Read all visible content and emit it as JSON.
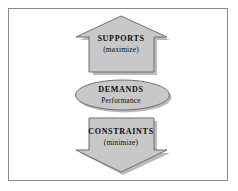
{
  "diagram": {
    "type": "flow-diagram",
    "frame": {
      "border_color": "#8a8a8a",
      "background_color": "#ffffff"
    },
    "style": {
      "shape_fill": "#c8c8c8",
      "shape_stroke": "#6e6e6e",
      "shadow_color": "#9a9a9a",
      "text_color": "#0d0d0d"
    },
    "shapes": [
      {
        "name": "supports",
        "shape": "arrow-up",
        "title": "SUPPORTS",
        "subtitle": "(maximize)"
      },
      {
        "name": "demands",
        "shape": "ellipse",
        "title": "DEMANDS",
        "subtitle": "Performance"
      },
      {
        "name": "constraints",
        "shape": "arrow-down",
        "title": "CONSTRAINTS",
        "subtitle": "(minimize)"
      }
    ]
  }
}
